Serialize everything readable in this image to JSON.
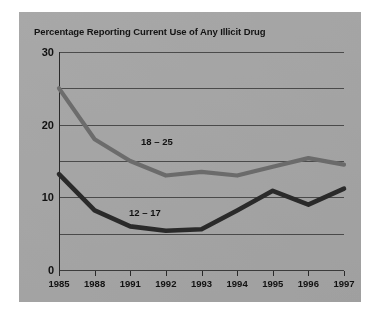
{
  "figure": {
    "background_color": "#a8a8a8",
    "page_color": "#ffffff"
  },
  "chart_data": {
    "type": "line",
    "title": "Percentage Reporting Current Use of Any Illicit Drug",
    "xlabel": "",
    "ylabel": "",
    "categories": [
      "1985",
      "1988",
      "1991",
      "1992",
      "1993",
      "1994",
      "1995",
      "1996",
      "1997"
    ],
    "ylim": [
      0,
      30
    ],
    "y_ticks_labeled": [
      0,
      10,
      20,
      30
    ],
    "y_gridlines": [
      0,
      5,
      10,
      15,
      20,
      25,
      30
    ],
    "grid": true,
    "legend": "inline-labels",
    "series": [
      {
        "name": "18 – 25",
        "color": "#6e6e6e",
        "values": [
          25.0,
          18.0,
          15.0,
          13.0,
          13.5,
          13.0,
          14.2,
          15.4,
          14.5
        ]
      },
      {
        "name": "12 – 17",
        "color": "#2b2b2b",
        "values": [
          13.2,
          8.2,
          6.0,
          5.4,
          5.6,
          8.2,
          10.9,
          9.0,
          11.2
        ]
      }
    ],
    "annotations": [
      {
        "text": "18 – 25",
        "near_category": "1991"
      },
      {
        "text": "12 – 17",
        "near_category": "1991"
      }
    ]
  },
  "axes": {
    "y_labels": [
      "30",
      "20",
      "10",
      "0"
    ],
    "x_labels": [
      "1985",
      "1988",
      "1991",
      "1992",
      "1993",
      "1994",
      "1995",
      "1996",
      "1997"
    ]
  }
}
